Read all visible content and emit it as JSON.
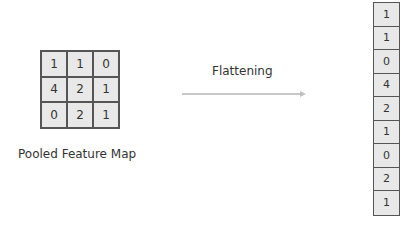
{
  "pooled_map": {
    "label": "Pooled Feature Map",
    "cells": [
      "1",
      "1",
      "0",
      "4",
      "2",
      "1",
      "0",
      "2",
      "1"
    ]
  },
  "operation": {
    "label": "Flattening"
  },
  "flattened": {
    "cells": [
      "1",
      "1",
      "0",
      "4",
      "2",
      "1",
      "0",
      "2",
      "1"
    ]
  }
}
